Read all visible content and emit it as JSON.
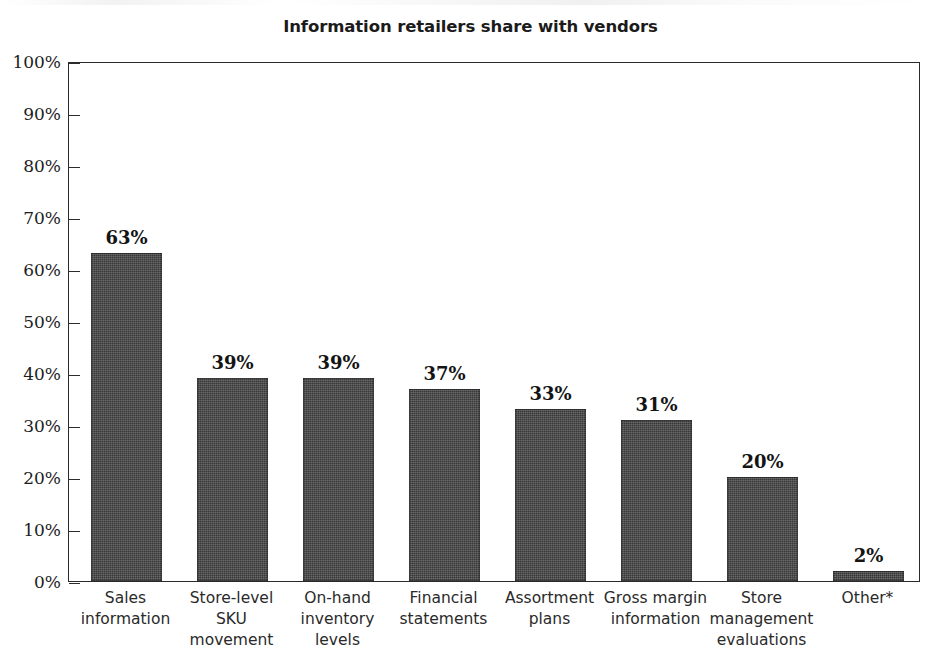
{
  "chart_data": {
    "type": "bar",
    "title": "Information retailers share with vendors",
    "xlabel": "",
    "ylabel": "",
    "ylim": [
      0,
      100
    ],
    "y_tick_labels": [
      "100%",
      "90%",
      "80%",
      "70%",
      "60%",
      "50%",
      "40%",
      "30%",
      "20%",
      "10%",
      "0%"
    ],
    "y_tick_values": [
      100,
      90,
      80,
      70,
      60,
      50,
      40,
      30,
      20,
      10,
      0
    ],
    "grid": false,
    "legend": "none",
    "bar_color": "#454545",
    "categories": [
      "Sales\ninformation",
      "Store-level\nSKU\nmovement",
      "On-hand\ninventory\nlevels",
      "Financial\nstatements",
      "Assortment\nplans",
      "Gross margin\ninformation",
      "Store\nmanagement\nevaluations",
      "Other*"
    ],
    "values": [
      63,
      39,
      39,
      37,
      33,
      31,
      20,
      2
    ],
    "value_labels": [
      "63%",
      "39%",
      "39%",
      "37%",
      "33%",
      "31%",
      "20%",
      "2%"
    ]
  }
}
